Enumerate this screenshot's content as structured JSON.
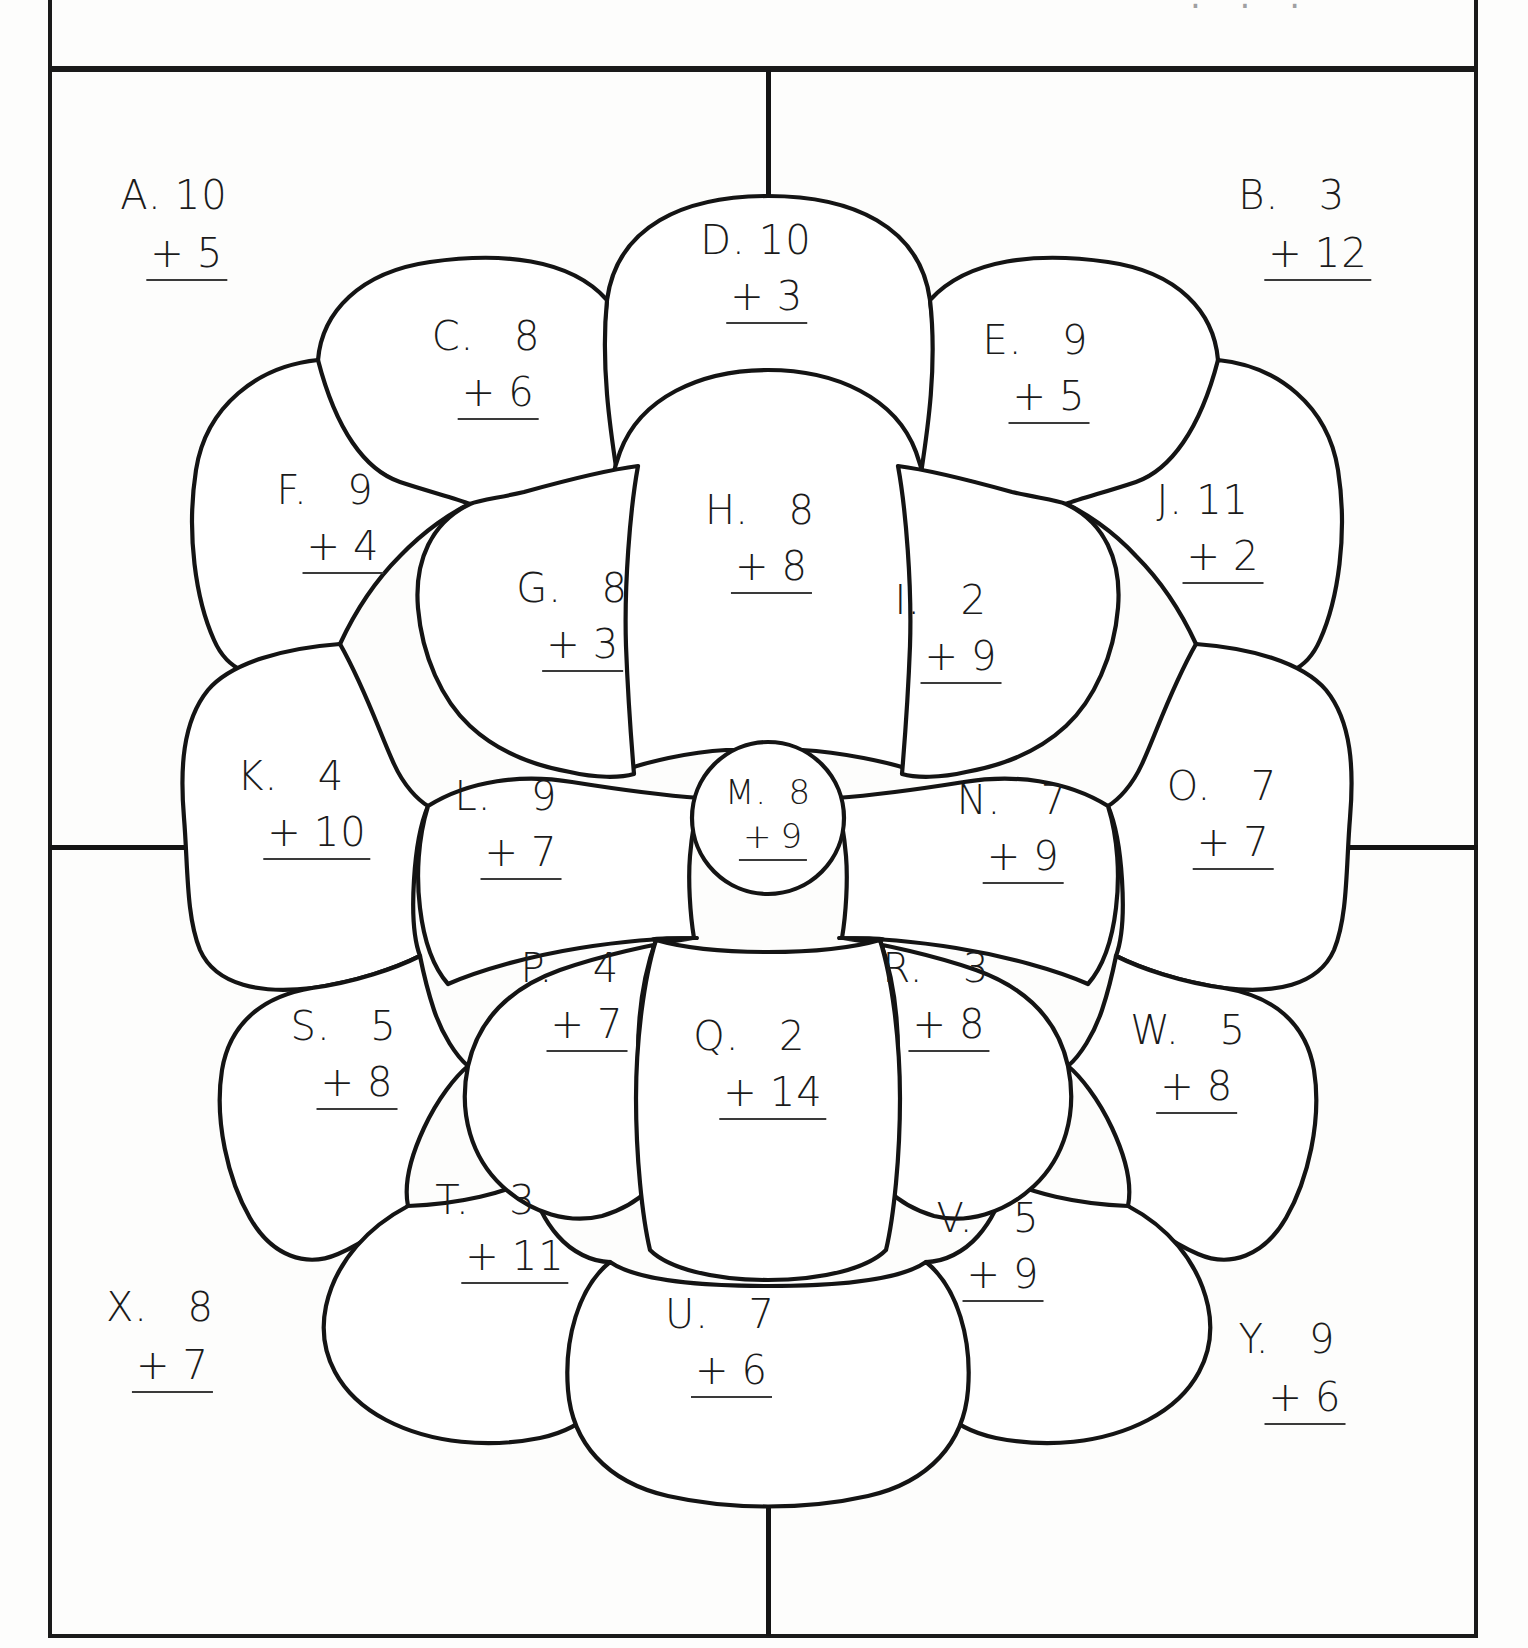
{
  "worksheet": {
    "title_clipped": "· · ·",
    "colors": {
      "ink": "#141414",
      "paper": "#fdfdfc",
      "pencil": "#3a3a3a"
    }
  },
  "problems": [
    {
      "id": "A",
      "label": "A.",
      "top": "10",
      "operator": "+",
      "bottom": "5",
      "zone": "corner-top-left"
    },
    {
      "id": "B",
      "label": "B.",
      "top": "3",
      "operator": "+",
      "bottom": "12",
      "zone": "corner-top-right"
    },
    {
      "id": "C",
      "label": "C.",
      "top": "8",
      "operator": "+",
      "bottom": "6",
      "zone": "outer-petal"
    },
    {
      "id": "D",
      "label": "D.",
      "top": "10",
      "operator": "+",
      "bottom": "3",
      "zone": "outer-petal"
    },
    {
      "id": "E",
      "label": "E.",
      "top": "9",
      "operator": "+",
      "bottom": "5",
      "zone": "outer-petal"
    },
    {
      "id": "F",
      "label": "F.",
      "top": "9",
      "operator": "+",
      "bottom": "4",
      "zone": "outer-petal"
    },
    {
      "id": "G",
      "label": "G.",
      "top": "8",
      "operator": "+",
      "bottom": "3",
      "zone": "inner-petal"
    },
    {
      "id": "H",
      "label": "H.",
      "top": "8",
      "operator": "+",
      "bottom": "8",
      "zone": "inner-petal"
    },
    {
      "id": "I",
      "label": "I.",
      "top": "2",
      "operator": "+",
      "bottom": "9",
      "zone": "inner-petal"
    },
    {
      "id": "J",
      "label": "J.",
      "top": "11",
      "operator": "+",
      "bottom": "2",
      "zone": "outer-petal"
    },
    {
      "id": "K",
      "label": "K.",
      "top": "4",
      "operator": "+",
      "bottom": "10",
      "zone": "outer-petal"
    },
    {
      "id": "L",
      "label": "L.",
      "top": "9",
      "operator": "+",
      "bottom": "7",
      "zone": "inner-petal"
    },
    {
      "id": "M",
      "label": "M.",
      "top": "8",
      "operator": "+",
      "bottom": "9",
      "zone": "center"
    },
    {
      "id": "N",
      "label": "N.",
      "top": "7",
      "operator": "+",
      "bottom": "9",
      "zone": "inner-petal"
    },
    {
      "id": "O",
      "label": "O.",
      "top": "7",
      "operator": "+",
      "bottom": "7",
      "zone": "outer-petal"
    },
    {
      "id": "P",
      "label": "P.",
      "top": "4",
      "operator": "+",
      "bottom": "7",
      "zone": "inner-petal"
    },
    {
      "id": "Q",
      "label": "Q.",
      "top": "2",
      "operator": "+",
      "bottom": "14",
      "zone": "inner-petal"
    },
    {
      "id": "R",
      "label": "R.",
      "top": "3",
      "operator": "+",
      "bottom": "8",
      "zone": "inner-petal"
    },
    {
      "id": "S",
      "label": "S.",
      "top": "5",
      "operator": "+",
      "bottom": "8",
      "zone": "outer-petal"
    },
    {
      "id": "T",
      "label": "T.",
      "top": "3",
      "operator": "+",
      "bottom": "11",
      "zone": "outer-petal"
    },
    {
      "id": "U",
      "label": "U.",
      "top": "7",
      "operator": "+",
      "bottom": "6",
      "zone": "outer-petal"
    },
    {
      "id": "V",
      "label": "V.",
      "top": "5",
      "operator": "+",
      "bottom": "9",
      "zone": "outer-petal"
    },
    {
      "id": "W",
      "label": "W.",
      "top": "5",
      "operator": "+",
      "bottom": "8",
      "zone": "outer-petal"
    },
    {
      "id": "X",
      "label": "X.",
      "top": "8",
      "operator": "+",
      "bottom": "7",
      "zone": "corner-bottom-left"
    },
    {
      "id": "Y",
      "label": "Y.",
      "top": "9",
      "operator": "+",
      "bottom": "6",
      "zone": "corner-bottom-right"
    }
  ]
}
